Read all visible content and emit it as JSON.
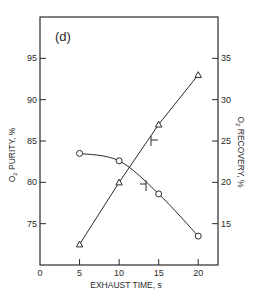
{
  "panel_label": "(d)",
  "chart_data": {
    "type": "line",
    "title": "",
    "panel": "(d)",
    "xlabel": "EXHAUST TIME, s",
    "ylabel": "O2 PURITY, %",
    "y2label": "O2 RECOVERY, %",
    "xlim": [
      0,
      22.5
    ],
    "ylim": [
      70,
      100
    ],
    "y2lim": [
      10,
      40
    ],
    "x_ticks": [
      0,
      5,
      10,
      15,
      20
    ],
    "y_ticks": [
      75,
      80,
      85,
      90,
      95
    ],
    "y2_ticks": [
      15,
      20,
      25,
      30,
      35
    ],
    "grid": false,
    "legend": "none (arrow markers indicate axis)",
    "x": [
      5,
      10,
      15,
      20
    ],
    "series": [
      {
        "name": "O2 Purity",
        "axis": "left",
        "marker": "circle",
        "values": [
          83.5,
          82.6,
          78.6,
          73.5
        ]
      },
      {
        "name": "O2 Recovery",
        "axis": "right",
        "marker": "triangle",
        "values": [
          12.5,
          20.0,
          27.0,
          33.0
        ]
      }
    ]
  },
  "labels": {
    "x_axis": "EXHAUST TIME, s",
    "y_left_prefix": "O",
    "y_left_sub": "2",
    "y_left_rest": " PURITY, %",
    "y_right_prefix": "O",
    "y_right_sub": "2",
    "y_right_rest": " RECOVERY, %"
  },
  "colors": {
    "ink": "#2a2a2a",
    "background": "#ffffff"
  }
}
